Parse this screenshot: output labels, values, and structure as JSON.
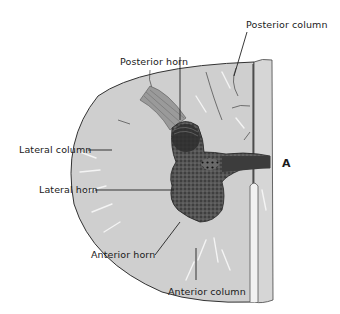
{
  "figure": {
    "panel_letter": "A",
    "colors": {
      "white_matter": "#cfcfcf",
      "white_matter_light": "#dcdcdc",
      "gray_matter": "#3a3a3a",
      "outline": "#333333",
      "leader_line": "#222222",
      "background": "#ffffff"
    }
  },
  "labels": [
    {
      "id": "posterior-column",
      "text": "Posterior column"
    },
    {
      "id": "posterior-horn",
      "text": "Posterior horn"
    },
    {
      "id": "lateral-column",
      "text": "Lateral column"
    },
    {
      "id": "lateral-horn",
      "text": "Lateral horn"
    },
    {
      "id": "anterior-horn",
      "text": "Anterior horn"
    },
    {
      "id": "anterior-column",
      "text": "Anterior column"
    }
  ]
}
